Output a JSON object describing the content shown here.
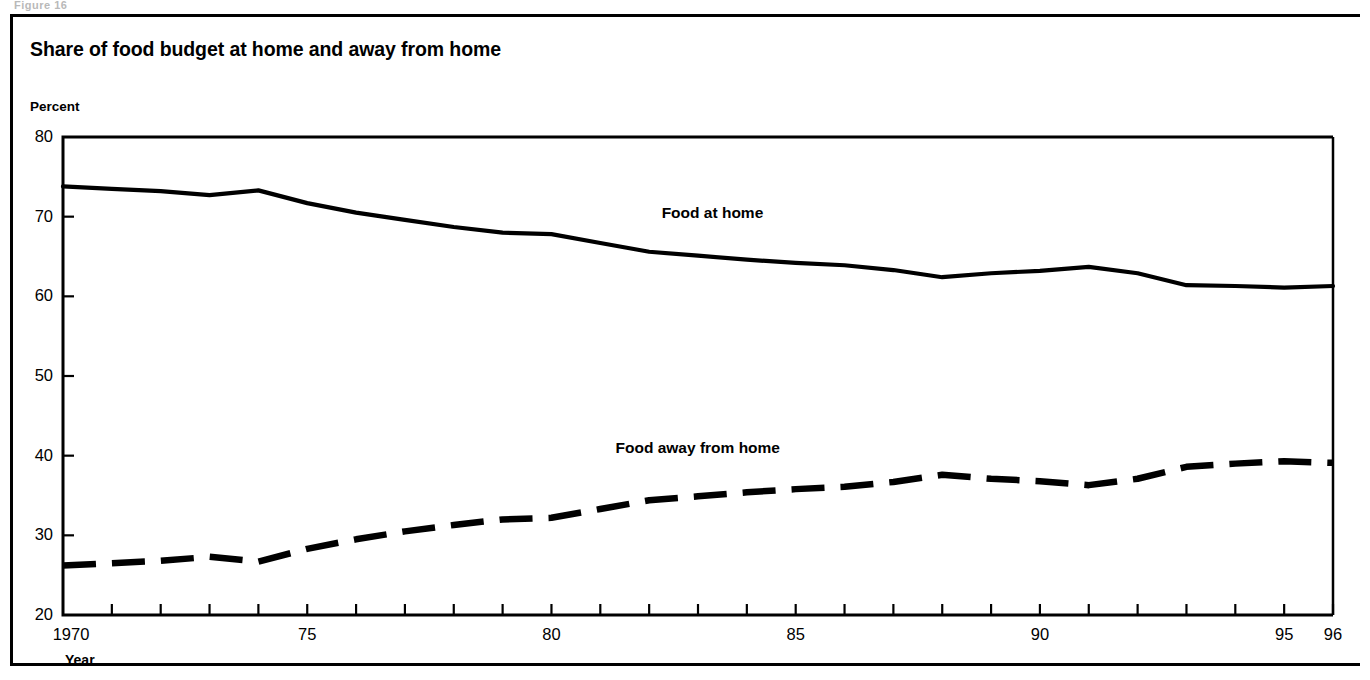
{
  "figure": {
    "title": "Share of food budget at home and away from home",
    "top_cut_text": "Figure 16",
    "unit_label": "Percent",
    "x_axis_title": "Year"
  },
  "chart_data": {
    "type": "line",
    "title": "Share of food budget at home and away from home",
    "xlabel": "Year",
    "ylabel": "Percent",
    "xlim": [
      1970,
      1996
    ],
    "ylim": [
      20,
      80
    ],
    "yticks": [
      20,
      30,
      40,
      50,
      60,
      70,
      80
    ],
    "ytick_labels": [
      "20",
      "30",
      "40",
      "50",
      "60",
      "70",
      "80"
    ],
    "xticks": [
      1970,
      1975,
      1980,
      1985,
      1990,
      1995,
      1996
    ],
    "xtick_labels": [
      "1970",
      "75",
      "80",
      "85",
      "90",
      "95",
      "96"
    ],
    "grid": false,
    "legend_position": "inline-annotation",
    "x": [
      1970,
      1971,
      1972,
      1973,
      1974,
      1975,
      1976,
      1977,
      1978,
      1979,
      1980,
      1981,
      1982,
      1983,
      1984,
      1985,
      1986,
      1987,
      1988,
      1989,
      1990,
      1991,
      1992,
      1993,
      1994,
      1995,
      1996
    ],
    "series": [
      {
        "name": "Food at home",
        "style": "solid",
        "color": "#000000",
        "label_x": 1983.3,
        "label_y": 70.5,
        "values": [
          73.8,
          73.5,
          73.2,
          72.7,
          73.3,
          71.7,
          70.5,
          69.6,
          68.7,
          68.0,
          67.8,
          66.7,
          65.6,
          65.1,
          64.6,
          64.2,
          63.9,
          63.3,
          62.4,
          62.9,
          63.2,
          63.7,
          62.9,
          61.4,
          61.3,
          61.1,
          61.3
        ]
      },
      {
        "name": "Food away from home",
        "style": "dashed",
        "color": "#000000",
        "label_x": 1983.0,
        "label_y": 41.0,
        "values": [
          26.2,
          26.5,
          26.8,
          27.3,
          26.7,
          28.3,
          29.5,
          30.5,
          31.3,
          32.0,
          32.2,
          33.3,
          34.4,
          34.9,
          35.4,
          35.8,
          36.1,
          36.7,
          37.6,
          37.1,
          36.8,
          36.3,
          37.1,
          38.6,
          39.0,
          39.3,
          39.1
        ]
      }
    ]
  }
}
